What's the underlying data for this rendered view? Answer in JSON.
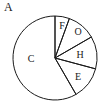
{
  "figure": {
    "label": "A",
    "background_color": "#ffffff",
    "stroke_color": "#1a1a1a",
    "text_color": "#1a1a1a"
  },
  "chart_data": {
    "type": "pie",
    "title": "A",
    "xlabel": "",
    "ylabel": "",
    "filled": false,
    "stroke_color": "#1a1a1a",
    "legend": "none",
    "labels_position": "inside-slices",
    "center": {
      "x": 55,
      "y": 58
    },
    "radius": 42,
    "start_angle_deg": 0,
    "direction": "clockwise",
    "categories": [
      "F",
      "O",
      "H",
      "E",
      "C"
    ],
    "values": [
      5.5,
      11,
      12.5,
      12.5,
      58.5
    ],
    "units": "percent",
    "slices": [
      {
        "label": "F",
        "value": 5.5,
        "start_deg": 0,
        "end_deg": 20,
        "label_x": 62,
        "label_y": 27
      },
      {
        "label": "O",
        "value": 11,
        "start_deg": 20,
        "end_deg": 60,
        "label_x": 78,
        "label_y": 33
      },
      {
        "label": "H",
        "value": 12.5,
        "start_deg": 60,
        "end_deg": 105,
        "label_x": 80,
        "label_y": 56
      },
      {
        "label": "E",
        "value": 12.5,
        "start_deg": 105,
        "end_deg": 150,
        "label_x": 78,
        "label_y": 78
      },
      {
        "label": "C",
        "value": 58.5,
        "start_deg": 150,
        "end_deg": 360,
        "label_x": 31,
        "label_y": 60
      }
    ]
  }
}
